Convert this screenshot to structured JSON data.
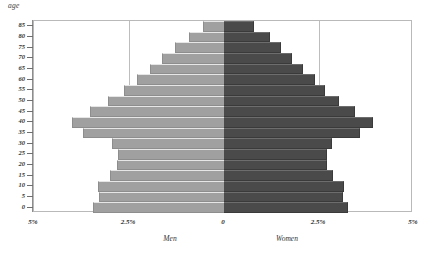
{
  "chart_data": {
    "type": "bar",
    "subtype": "population-pyramid",
    "title": "",
    "xlabel": "",
    "ylabel": "age",
    "grid": true,
    "legend_position": "below-axis",
    "xlim": [
      -5,
      5
    ],
    "xtick_labels": [
      "5%",
      "2.5%",
      "0",
      "2.5%",
      "5%"
    ],
    "xtick_values": [
      -5,
      -2.5,
      0,
      2.5,
      5
    ],
    "ytick_labels": [
      "85",
      "80",
      "75",
      "70",
      "65",
      "60",
      "55",
      "50",
      "45",
      "40",
      "35",
      "30",
      "25",
      "20",
      "15",
      "10",
      "5",
      "0"
    ],
    "categories": [
      "0",
      "5",
      "10",
      "15",
      "20",
      "25",
      "30",
      "35",
      "40",
      "45",
      "50",
      "55",
      "60",
      "65",
      "70",
      "75",
      "80",
      "85"
    ],
    "series": [
      {
        "name": "Men",
        "color": "#a0a0a0",
        "side": "left",
        "values": [
          3.45,
          3.3,
          3.32,
          3.0,
          2.82,
          2.8,
          2.95,
          3.7,
          4.0,
          3.52,
          3.05,
          2.62,
          2.3,
          1.95,
          1.62,
          1.28,
          0.92,
          0.55
        ]
      },
      {
        "name": "Women",
        "color": "#4a4a4a",
        "side": "right",
        "values": [
          3.25,
          3.12,
          3.15,
          2.86,
          2.7,
          2.7,
          2.85,
          3.58,
          3.92,
          3.45,
          3.02,
          2.66,
          2.4,
          2.08,
          1.8,
          1.5,
          1.2,
          0.78
        ]
      }
    ],
    "annotations": {
      "men_label": "Men",
      "women_label": "Women",
      "age_label": "age"
    }
  },
  "colors": {
    "men": "#a0a0a0",
    "women": "#4a4a4a",
    "frame": "#b9b9b9",
    "grid": "#bdbdbd",
    "text": "#303030",
    "background": "#ffffff"
  }
}
